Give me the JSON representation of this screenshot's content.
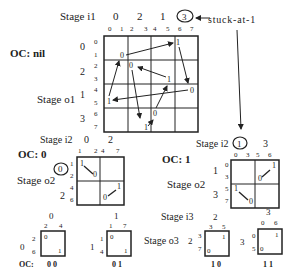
{
  "main_grid": {
    "stage_in_label": "Stage  i1",
    "stage_out_label": "Stage  o1",
    "oc_label": "OC: nil",
    "top_groups": [
      "0",
      "2",
      "1",
      "3"
    ],
    "top_cols": [
      "0",
      "1",
      "2",
      "3",
      "4",
      "5",
      "6",
      "7"
    ],
    "left_groups": [
      "0",
      "2",
      "1",
      "3"
    ],
    "left_rows": [
      "0",
      "1",
      "2",
      "3",
      "4",
      "5",
      "6",
      "7"
    ],
    "cell_values": [
      {
        "text": "0",
        "x": 121,
        "y": 58
      },
      {
        "text": "1",
        "x": 177,
        "y": 44
      },
      {
        "text": "0",
        "x": 129,
        "y": 66
      },
      {
        "text": "1",
        "x": 167,
        "y": 80
      },
      {
        "text": "0",
        "x": 191,
        "y": 91
      },
      {
        "text": "1",
        "x": 107,
        "y": 102
      },
      {
        "text": "0",
        "x": 155,
        "y": 113
      },
      {
        "text": "1",
        "x": 145,
        "y": 128
      }
    ],
    "fault_circle": "3",
    "fault_label": "stuck-at-1"
  },
  "sub_oc0": {
    "oc_label": "OC: 0",
    "stage_in_label": "Stage  i2",
    "stage_out_label": "Stage  o2",
    "top_groups": [
      "0",
      "2"
    ],
    "top_cols": [
      "1",
      "2",
      "4",
      "7"
    ],
    "left_groups": [
      "0",
      "2"
    ],
    "left_rows": [
      "1",
      "2",
      "4",
      "6"
    ],
    "circled_group": "0",
    "cells": [
      {
        "text": "1"
      },
      {
        "text": "0"
      },
      {
        "text": "0"
      },
      {
        "text": "1"
      }
    ]
  },
  "sub_oc1": {
    "oc_label": "OC: 1",
    "stage_in_label": "Stage  i2",
    "stage_out_label": "Stage  o2",
    "top_groups": [
      "1",
      "3"
    ],
    "top_cols": [
      "0",
      "3",
      "5",
      "6"
    ],
    "left_groups": [
      "1",
      "3"
    ],
    "left_rows": [
      "0",
      "3",
      "5",
      "7"
    ],
    "circled_group": "1",
    "cells": [
      {
        "text": "0"
      },
      {
        "text": "1"
      },
      {
        "text": "1"
      },
      {
        "text": "0"
      }
    ]
  },
  "leaf_00": {
    "top_group": "0",
    "cols": [
      "2",
      "4"
    ],
    "left_group": "0",
    "rows": [
      "2",
      "6"
    ],
    "tl": "0",
    "br": "1",
    "oc": "0 0"
  },
  "leaf_01": {
    "top_group": "1",
    "cols": [
      "1",
      "7"
    ],
    "left_group": "1",
    "rows": [
      "1",
      "4"
    ],
    "tl": "0",
    "br": "1",
    "oc": "0 1"
  },
  "leaf_10": {
    "top_group": "2",
    "cols": [
      "3",
      "5"
    ],
    "left_group": "2",
    "rows": [
      "3",
      "7"
    ],
    "tr": "1",
    "bl": "0",
    "oc": "1 0"
  },
  "leaf_11": {
    "top_group": "3",
    "cols": [
      "0",
      "6"
    ],
    "left_group": "3",
    "rows": [
      "0",
      "5"
    ],
    "tr": "1",
    "bl": "0",
    "oc": "1 1"
  },
  "bottom": {
    "oc_prefix": "OC:",
    "stage_in3_label": "Stage  i3",
    "stage_out3_label": "Stage  o3"
  }
}
